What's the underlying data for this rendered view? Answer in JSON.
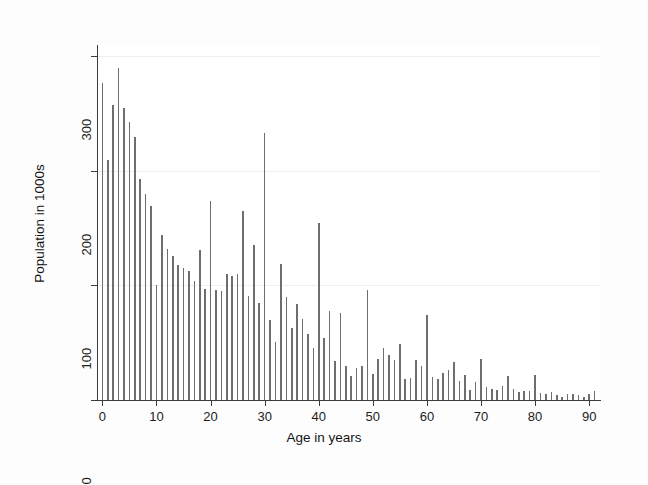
{
  "chart_data": {
    "type": "bar",
    "title": "",
    "xlabel": "Age in years",
    "ylabel": "Population in 1000s",
    "xlim": [
      -1,
      92
    ],
    "ylim": [
      0,
      310
    ],
    "grid": true,
    "legend": null,
    "bar_color": "#6e6e6e",
    "axis_color": "#3d3d3d",
    "background": "#ffffff",
    "x_ticks": [
      0,
      10,
      20,
      30,
      40,
      50,
      60,
      70,
      80,
      90
    ],
    "x_tick_labels": [
      "0",
      "10",
      "20",
      "30",
      "40",
      "50",
      "60",
      "70",
      "80",
      "90"
    ],
    "y_ticks": [
      0,
      100,
      200,
      300
    ],
    "y_tick_labels": [
      "0",
      "100",
      "200",
      "300"
    ],
    "categories": [
      0,
      1,
      2,
      3,
      4,
      5,
      6,
      7,
      8,
      9,
      10,
      11,
      12,
      13,
      14,
      15,
      16,
      17,
      18,
      19,
      20,
      21,
      22,
      23,
      24,
      25,
      26,
      27,
      28,
      29,
      30,
      31,
      32,
      33,
      34,
      35,
      36,
      37,
      38,
      39,
      40,
      41,
      42,
      43,
      44,
      45,
      46,
      47,
      48,
      49,
      50,
      51,
      52,
      53,
      54,
      55,
      56,
      57,
      58,
      59,
      60,
      61,
      62,
      63,
      64,
      65,
      66,
      67,
      68,
      69,
      70,
      71,
      72,
      73,
      74,
      75,
      76,
      77,
      78,
      79,
      80,
      81,
      82,
      83,
      84,
      85,
      86,
      87,
      88,
      89,
      90,
      91
    ],
    "values": [
      277,
      210,
      258,
      290,
      255,
      243,
      230,
      193,
      180,
      169,
      100,
      144,
      132,
      126,
      118,
      115,
      113,
      104,
      131,
      97,
      174,
      96,
      95,
      110,
      108,
      110,
      165,
      91,
      135,
      85,
      233,
      70,
      51,
      119,
      90,
      63,
      84,
      71,
      58,
      45,
      155,
      54,
      78,
      34,
      76,
      30,
      21,
      28,
      30,
      96,
      23,
      36,
      45,
      39,
      35,
      49,
      18,
      19,
      35,
      30,
      74,
      20,
      18,
      24,
      26,
      33,
      17,
      22,
      9,
      16,
      36,
      11,
      10,
      9,
      12,
      21,
      10,
      7,
      8,
      8,
      22,
      6,
      5,
      7,
      4,
      3,
      5,
      5,
      4,
      3,
      5,
      8
    ]
  }
}
